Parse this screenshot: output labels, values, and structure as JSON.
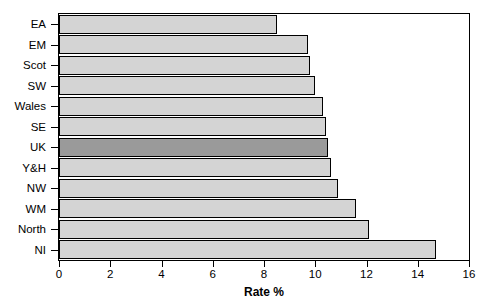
{
  "chart_data": {
    "type": "bar",
    "orientation": "horizontal",
    "title": "",
    "xlabel": "Rate %",
    "ylabel": "",
    "xlim": [
      0,
      16
    ],
    "xticks": [
      0,
      2,
      4,
      6,
      8,
      10,
      12,
      14,
      16
    ],
    "grid": false,
    "legend": null,
    "highlight_category": "UK",
    "colors": {
      "bar_fill": "#d4d4d4",
      "bar_highlight_fill": "#9a9a9a",
      "bar_stroke": "#000000",
      "axis": "#000000",
      "background": "#ffffff"
    },
    "categories": [
      "EA",
      "EM",
      "Scot",
      "SW",
      "Wales",
      "SE",
      "UK",
      "Y&H",
      "NW",
      "WM",
      "North",
      "NI"
    ],
    "values": [
      8.5,
      9.7,
      9.8,
      10.0,
      10.3,
      10.4,
      10.5,
      10.6,
      10.9,
      11.6,
      12.1,
      14.7
    ]
  }
}
